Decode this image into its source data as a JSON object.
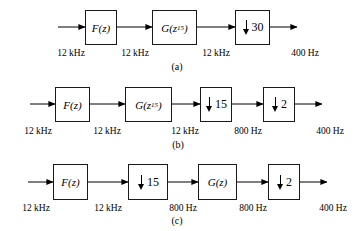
{
  "figure": {
    "background_color": "#ffffff",
    "line_color": "#1a1a1a",
    "rows": [
      {
        "id": "a",
        "caption": "(a)",
        "blocks": [
          {
            "name": "filter-f",
            "kind": "filter",
            "label": "F(z)",
            "base": "F(z)"
          },
          {
            "name": "filter-g-z15",
            "kind": "filter",
            "label": "G(z15)",
            "base": "G(z",
            "exponent": "15",
            "tail": ")"
          },
          {
            "name": "downsampler-30",
            "kind": "downsampler",
            "label": "30",
            "factor": "30"
          }
        ],
        "rates": [
          "12 kHz",
          "12 kHz",
          "12 kHz",
          "400 Hz"
        ]
      },
      {
        "id": "b",
        "caption": "(b)",
        "blocks": [
          {
            "name": "filter-f",
            "kind": "filter",
            "label": "F(z)",
            "base": "F(z)"
          },
          {
            "name": "filter-g-z15",
            "kind": "filter",
            "label": "G(z15)",
            "base": "G(z",
            "exponent": "15",
            "tail": ")"
          },
          {
            "name": "downsampler-15",
            "kind": "downsampler",
            "label": "15",
            "factor": "15"
          },
          {
            "name": "downsampler-2",
            "kind": "downsampler",
            "label": "2",
            "factor": "2"
          }
        ],
        "rates": [
          "12 kHz",
          "12 kHz",
          "12 kHz",
          "800 Hz",
          "400 Hz"
        ]
      },
      {
        "id": "c",
        "caption": "(c)",
        "blocks": [
          {
            "name": "filter-f",
            "kind": "filter",
            "label": "F(z)",
            "base": "F(z)"
          },
          {
            "name": "downsampler-15",
            "kind": "downsampler",
            "label": "15",
            "factor": "15"
          },
          {
            "name": "filter-g",
            "kind": "filter",
            "label": "G(z)",
            "base": "G(z)"
          },
          {
            "name": "downsampler-2",
            "kind": "downsampler",
            "label": "2",
            "factor": "2"
          }
        ],
        "rates": [
          "12 kHz",
          "12 kHz",
          "800 Hz",
          "800 Hz",
          "400 Hz"
        ]
      }
    ]
  }
}
